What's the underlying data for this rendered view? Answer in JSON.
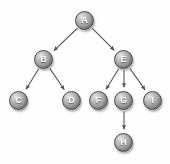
{
  "diagram": {
    "type": "tree",
    "width": 170,
    "height": 164,
    "background_color": "#fefefe",
    "node_fill_color": "#a8a8a8",
    "node_border_color": "#4a4a4a",
    "node_label_color": "#ffffff",
    "edge_color": "#555555",
    "node_radius": 9.5,
    "nodes": [
      {
        "id": "A",
        "label": "A",
        "cx": 85,
        "cy": 21,
        "level": 0
      },
      {
        "id": "B",
        "label": "B",
        "cx": 44,
        "cy": 60,
        "level": 1
      },
      {
        "id": "E",
        "label": "E",
        "cx": 124,
        "cy": 60,
        "level": 1
      },
      {
        "id": "C",
        "label": "C",
        "cx": 19,
        "cy": 101,
        "level": 2
      },
      {
        "id": "D",
        "label": "D",
        "cx": 72,
        "cy": 101,
        "level": 2
      },
      {
        "id": "F",
        "label": "F",
        "cx": 99,
        "cy": 101,
        "level": 2
      },
      {
        "id": "G",
        "label": "G",
        "cx": 124,
        "cy": 101,
        "level": 2
      },
      {
        "id": "I",
        "label": "I",
        "cx": 153,
        "cy": 101,
        "level": 2
      },
      {
        "id": "H",
        "label": "H",
        "cx": 124,
        "cy": 143,
        "level": 3
      }
    ],
    "edges": [
      {
        "from": "A",
        "to": "B",
        "directed": true
      },
      {
        "from": "A",
        "to": "E",
        "directed": true
      },
      {
        "from": "B",
        "to": "C",
        "directed": true
      },
      {
        "from": "B",
        "to": "D",
        "directed": true
      },
      {
        "from": "E",
        "to": "F",
        "directed": true
      },
      {
        "from": "E",
        "to": "G",
        "directed": true
      },
      {
        "from": "E",
        "to": "I",
        "directed": true
      },
      {
        "from": "G",
        "to": "H",
        "directed": true
      }
    ]
  }
}
